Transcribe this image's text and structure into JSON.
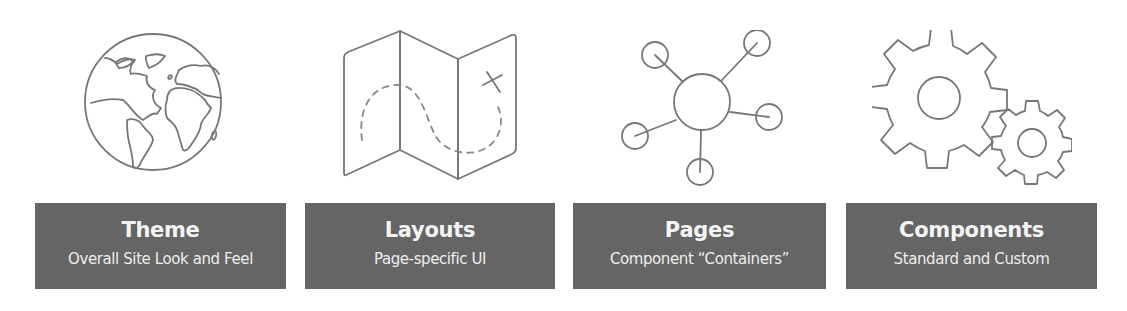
{
  "diagram": {
    "items": [
      {
        "icon": "globe-icon",
        "title": "Theme",
        "subtitle": "Overall Site Look and Feel"
      },
      {
        "icon": "map-icon",
        "title": "Layouts",
        "subtitle": "Page-specific UI"
      },
      {
        "icon": "network-hub-icon",
        "title": "Pages",
        "subtitle": "Component “Containers”"
      },
      {
        "icon": "gears-icon",
        "title": "Components",
        "subtitle": "Standard and Custom"
      }
    ],
    "colors": {
      "label_background": "#656565",
      "label_text": "#f2f2f2",
      "icon_stroke": "#777777",
      "background": "#ffffff"
    }
  }
}
